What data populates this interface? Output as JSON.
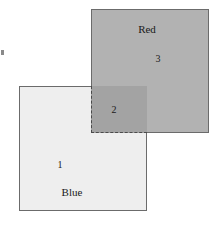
{
  "figure": {
    "background_color": "#ffffff"
  },
  "regions": [
    {
      "id": "blue-square",
      "name_label": "Blue",
      "number_label": "1",
      "fill_color": "#eeeeee",
      "stroke_color": "#6b6b6b",
      "stroke_style": "solid"
    },
    {
      "id": "intersection",
      "name_label": "",
      "number_label": "2",
      "fill_color": "#a3a3a3",
      "stroke_color": "#4a4a4a",
      "stroke_style": "dashed"
    },
    {
      "id": "red-square",
      "name_label": "Red",
      "number_label": "3",
      "fill_color": "#b2b2b2",
      "stroke_color": "#6b6b6b",
      "stroke_style": "solid"
    }
  ],
  "labels": {
    "red": "Red",
    "three": "3",
    "two": "2",
    "one": "1",
    "blue": "Blue"
  }
}
